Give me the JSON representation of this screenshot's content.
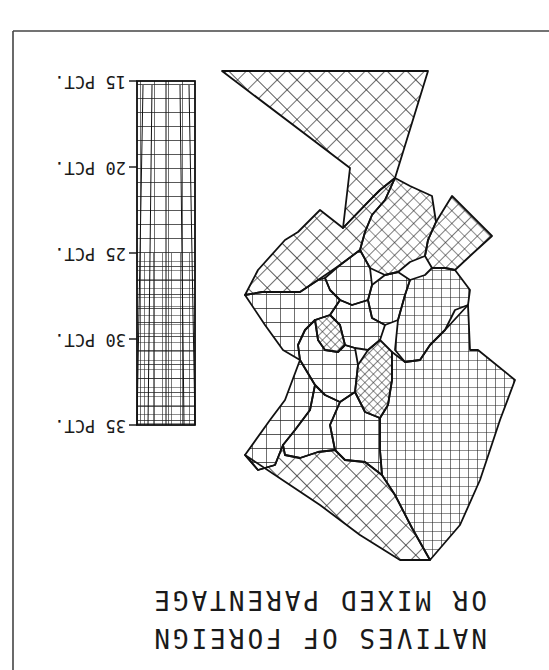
{
  "map": {
    "title_line1": "NATIVES OF FOREIGN",
    "title_line2": "OR MIXED PARENTAGE",
    "orientation": "rotated 180 degrees",
    "ink_color": "#111111",
    "paper_color": "#ffffff"
  },
  "legend": {
    "ticks": [
      {
        "value": 15,
        "label": "15 PCT."
      },
      {
        "value": 20,
        "label": "20 PCT."
      },
      {
        "value": 25,
        "label": "25 PCT."
      },
      {
        "value": 30,
        "label": "30 PCT."
      },
      {
        "value": 35,
        "label": "35 PCT."
      }
    ],
    "fill_style": "crosshatch grid, denser at higher percentage"
  },
  "tracts": [
    {
      "id": "north-wedge",
      "shade": "light"
    },
    {
      "id": "northwest-arm",
      "shade": "light"
    },
    {
      "id": "northeast-tip",
      "shade": "medium"
    },
    {
      "id": "north-central",
      "shade": "medium"
    },
    {
      "id": "central-dark",
      "shade": "dark"
    },
    {
      "id": "west-dark",
      "shade": "dark"
    },
    {
      "id": "east-block",
      "shade": "medium"
    },
    {
      "id": "southeast-large",
      "shade": "medium"
    },
    {
      "id": "southwest-large",
      "shade": "light"
    },
    {
      "id": "west-edge",
      "shade": "light"
    }
  ]
}
